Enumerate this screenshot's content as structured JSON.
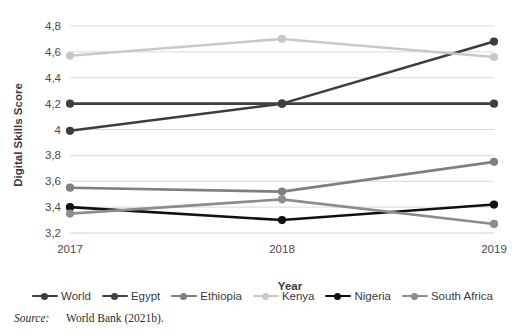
{
  "chart_data": {
    "type": "line",
    "title": "",
    "xlabel": "Year",
    "ylabel": "Digital Skills Score",
    "categories": [
      "2017",
      "2018",
      "2019"
    ],
    "x": [
      2017,
      2018,
      2019
    ],
    "ylim": [
      3.2,
      4.8
    ],
    "ytick_step": 0.2,
    "ytick_labels": [
      "4,8",
      "4,6",
      "4,4",
      "4,2",
      "4",
      "3,8",
      "3,6",
      "3,4",
      "3,2"
    ],
    "ytick_values": [
      4.8,
      4.6,
      4.4,
      4.2,
      4.0,
      3.8,
      3.6,
      3.4,
      3.2
    ],
    "grid": true,
    "legend_position": "bottom",
    "decimal_separator": ",",
    "series": [
      {
        "name": "World",
        "values": [
          3.99,
          4.2,
          4.68
        ],
        "color": "#3d3d3d"
      },
      {
        "name": "Egypt",
        "values": [
          4.2,
          4.2,
          4.2
        ],
        "color": "#404040"
      },
      {
        "name": "Ethiopia",
        "values": [
          3.55,
          3.52,
          3.75
        ],
        "color": "#7f7f7f"
      },
      {
        "name": "Kenya",
        "values": [
          4.57,
          4.7,
          4.56
        ],
        "color": "#c8c8c8"
      },
      {
        "name": "Nigeria",
        "values": [
          3.4,
          3.3,
          3.42
        ],
        "color": "#111111"
      },
      {
        "name": "South Africa",
        "values": [
          3.35,
          3.46,
          3.27
        ],
        "color": "#8c8c8c"
      }
    ]
  },
  "legend": {
    "items": [
      {
        "label": "World"
      },
      {
        "label": "Egypt"
      },
      {
        "label": "Ethiopia"
      },
      {
        "label": "Kenya"
      },
      {
        "label": "Nigeria"
      },
      {
        "label": "South Africa"
      }
    ]
  },
  "source": {
    "label": "Source:",
    "text": "World Bank (2021b)."
  }
}
